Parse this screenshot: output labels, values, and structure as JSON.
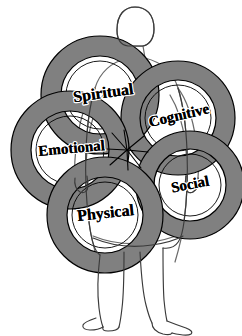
{
  "diagram": {
    "background_color": "#ffffff",
    "ring_fill_color": "#808080",
    "outline_color": "#000000",
    "figure_outline_color": "#555555",
    "convergence_point": {
      "x": 127,
      "y": 150
    },
    "rings": [
      {
        "id": "spiritual",
        "label": "Spiritual",
        "cx": 100,
        "cy": 95,
        "outer_radius": 59,
        "inner_radius": 39,
        "label_x": 104,
        "label_y": 98,
        "label_rotation": -8,
        "font_size": 16
      },
      {
        "id": "cognitive",
        "label": "Cognitive",
        "cx": 178,
        "cy": 118,
        "outer_radius": 57,
        "inner_radius": 38,
        "label_x": 180,
        "label_y": 120,
        "label_rotation": -13,
        "font_size": 15
      },
      {
        "id": "emotional",
        "label": "Emotional",
        "cx": 70,
        "cy": 150,
        "outer_radius": 59,
        "inner_radius": 39,
        "label_x": 72,
        "label_y": 153,
        "label_rotation": -5,
        "font_size": 15
      },
      {
        "id": "social",
        "label": "Social",
        "cx": 190,
        "cy": 185,
        "outer_radius": 54,
        "inner_radius": 36,
        "label_x": 191,
        "label_y": 189,
        "label_rotation": -11,
        "font_size": 15
      },
      {
        "id": "physical",
        "label": "Physical",
        "cx": 105,
        "cy": 215,
        "outer_radius": 58,
        "inner_radius": 38,
        "label_x": 106,
        "label_y": 218,
        "label_rotation": -6,
        "font_size": 16
      }
    ]
  },
  "human_figure": {
    "name": "standing-person-silhouette",
    "parts": [
      "head",
      "neck",
      "torso",
      "left-arm",
      "right-arm",
      "left-leg",
      "right-leg",
      "left-foot",
      "right-foot"
    ]
  }
}
